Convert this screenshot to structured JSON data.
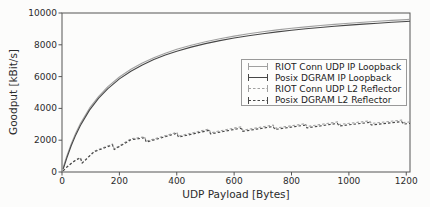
{
  "chart_data": {
    "type": "line",
    "title": "",
    "xlabel": "UDP Payload [Bytes]",
    "ylabel": "Goodput [kBit/s]",
    "xlim": [
      0,
      1213
    ],
    "ylim": [
      0,
      10000
    ],
    "xticks": [
      0,
      200,
      400,
      600,
      800,
      1000,
      1200
    ],
    "yticks": [
      0,
      2000,
      4000,
      6000,
      8000,
      10000
    ],
    "grid": false,
    "legend_position": "upper right",
    "axis_color": "#555555",
    "text_color": "#2b2b2b",
    "series": [
      {
        "name": "RIOT Conn UDP IP Loopback",
        "color": "#a0a0a0",
        "dash": "solid",
        "marker": "errorbar",
        "points": [
          [
            4,
            250
          ],
          [
            8,
            504
          ],
          [
            16,
            964
          ],
          [
            32,
            1770
          ],
          [
            48,
            2456
          ],
          [
            64,
            3047
          ],
          [
            96,
            4010
          ],
          [
            128,
            4762
          ],
          [
            160,
            5366
          ],
          [
            200,
            5973
          ],
          [
            240,
            6459
          ],
          [
            280,
            6858
          ],
          [
            320,
            7191
          ],
          [
            360,
            7474
          ],
          [
            400,
            7717
          ],
          [
            450,
            7975
          ],
          [
            500,
            8195
          ],
          [
            550,
            8385
          ],
          [
            600,
            8549
          ],
          [
            650,
            8693
          ],
          [
            700,
            8821
          ],
          [
            750,
            8934
          ],
          [
            800,
            9036
          ],
          [
            850,
            9127
          ],
          [
            900,
            9211
          ],
          [
            950,
            9286
          ],
          [
            1000,
            9356
          ],
          [
            1050,
            9420
          ],
          [
            1100,
            9479
          ],
          [
            1150,
            9533
          ],
          [
            1200,
            9584
          ],
          [
            1213,
            9597
          ]
        ]
      },
      {
        "name": "Posix DGRAM IP Loopback",
        "color": "#474747",
        "dash": "solid",
        "marker": "errorbar",
        "points": [
          [
            4,
            190
          ],
          [
            8,
            390
          ],
          [
            16,
            845
          ],
          [
            32,
            1650
          ],
          [
            48,
            2336
          ],
          [
            64,
            2927
          ],
          [
            96,
            3890
          ],
          [
            128,
            4642
          ],
          [
            160,
            5246
          ],
          [
            200,
            5853
          ],
          [
            240,
            6339
          ],
          [
            280,
            6738
          ],
          [
            320,
            7071
          ],
          [
            360,
            7354
          ],
          [
            400,
            7597
          ],
          [
            450,
            7855
          ],
          [
            500,
            8075
          ],
          [
            550,
            8265
          ],
          [
            600,
            8429
          ],
          [
            650,
            8573
          ],
          [
            700,
            8701
          ],
          [
            750,
            8814
          ],
          [
            800,
            8916
          ],
          [
            850,
            9007
          ],
          [
            900,
            9091
          ],
          [
            950,
            9166
          ],
          [
            1000,
            9236
          ],
          [
            1050,
            9300
          ],
          [
            1100,
            9359
          ],
          [
            1150,
            9413
          ],
          [
            1200,
            9464
          ],
          [
            1213,
            9477
          ]
        ]
      },
      {
        "name": "RIOT Conn UDP L2 Reflector",
        "color": "#a0a0a0",
        "dash": "dashed",
        "marker": "errorbar",
        "points": [
          [
            4,
            75
          ],
          [
            8,
            150
          ],
          [
            16,
            300
          ],
          [
            24,
            430
          ],
          [
            32,
            550
          ],
          [
            40,
            660
          ],
          [
            48,
            760
          ],
          [
            56,
            845
          ],
          [
            64,
            911
          ],
          [
            70,
            570
          ],
          [
            112,
            1310
          ],
          [
            176,
            1760
          ],
          [
            182,
            1450
          ],
          [
            240,
            2090
          ],
          [
            288,
            2215
          ],
          [
            294,
            1940
          ],
          [
            400,
            2500
          ],
          [
            406,
            2255
          ],
          [
            512,
            2700
          ],
          [
            518,
            2470
          ],
          [
            624,
            2840
          ],
          [
            630,
            2630
          ],
          [
            736,
            2950
          ],
          [
            742,
            2755
          ],
          [
            848,
            3040
          ],
          [
            854,
            2860
          ],
          [
            960,
            3150
          ],
          [
            966,
            2985
          ],
          [
            1072,
            3215
          ],
          [
            1078,
            3050
          ],
          [
            1184,
            3265
          ],
          [
            1190,
            3105
          ],
          [
            1213,
            3150
          ]
        ]
      },
      {
        "name": "Posix DGRAM L2 Reflector",
        "color": "#474747",
        "dash": "dashed",
        "marker": "errorbar",
        "points": [
          [
            4,
            73
          ],
          [
            8,
            146
          ],
          [
            16,
            291
          ],
          [
            24,
            417
          ],
          [
            32,
            534
          ],
          [
            40,
            640
          ],
          [
            48,
            737
          ],
          [
            56,
            820
          ],
          [
            64,
            884
          ],
          [
            70,
            553
          ],
          [
            112,
            1271
          ],
          [
            176,
            1707
          ],
          [
            182,
            1407
          ],
          [
            240,
            2027
          ],
          [
            288,
            2149
          ],
          [
            294,
            1882
          ],
          [
            400,
            2425
          ],
          [
            406,
            2187
          ],
          [
            512,
            2619
          ],
          [
            518,
            2396
          ],
          [
            624,
            2755
          ],
          [
            630,
            2551
          ],
          [
            736,
            2862
          ],
          [
            742,
            2672
          ],
          [
            848,
            2949
          ],
          [
            854,
            2774
          ],
          [
            960,
            3056
          ],
          [
            966,
            2895
          ],
          [
            1072,
            3119
          ],
          [
            1078,
            2959
          ],
          [
            1184,
            3167
          ],
          [
            1190,
            3012
          ],
          [
            1213,
            3056
          ]
        ]
      }
    ]
  }
}
